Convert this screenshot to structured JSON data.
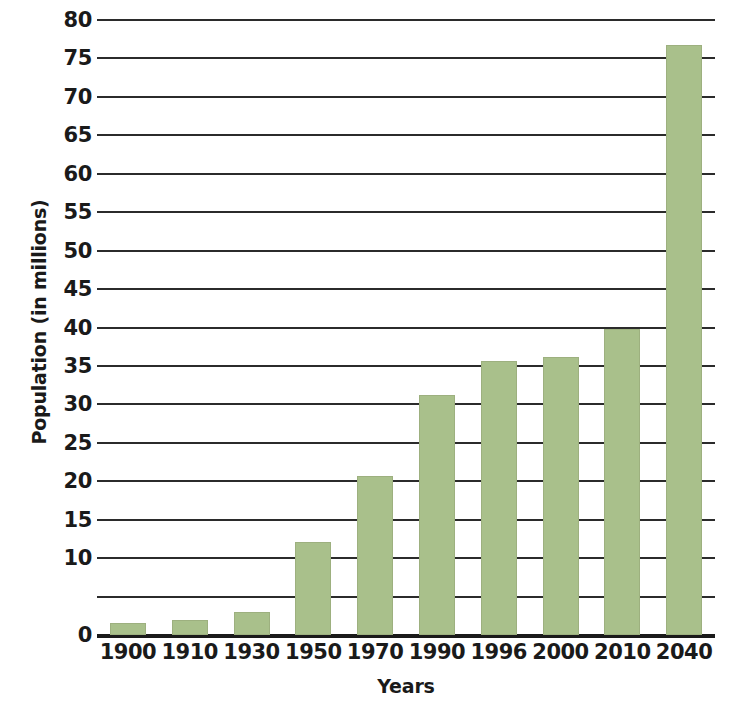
{
  "chart_data": {
    "type": "bar",
    "title": "",
    "xlabel": "Years",
    "ylabel": "Population (in millions)",
    "categories": [
      "1900",
      "1910",
      "1930",
      "1950",
      "1970",
      "1990",
      "1996",
      "2000",
      "2010",
      "2040"
    ],
    "values": [
      1.5,
      1.9,
      3.0,
      12.1,
      20.7,
      31.2,
      35.6,
      36.2,
      39.8,
      76.8
    ],
    "series": [
      {
        "name": "Population (in millions)",
        "values": [
          1.5,
          1.9,
          3.0,
          12.1,
          20.7,
          31.2,
          35.6,
          36.2,
          39.8,
          76.8
        ]
      }
    ],
    "ylim": [
      0,
      80
    ],
    "ytick_values": [
      80,
      75,
      70,
      65,
      60,
      55,
      50,
      45,
      40,
      35,
      30,
      25,
      20,
      15,
      10,
      5,
      0
    ],
    "ytick_labels": [
      "80",
      "75",
      "70",
      "65",
      "60",
      "55",
      "50",
      "45",
      "40",
      "35",
      "30",
      "25",
      "20",
      "15",
      "10",
      "",
      "0"
    ],
    "grid": true,
    "legend": "none",
    "bar_color": "#a9c08b",
    "axis_color": "#1a1a1a",
    "background_color": "#ffffff"
  }
}
